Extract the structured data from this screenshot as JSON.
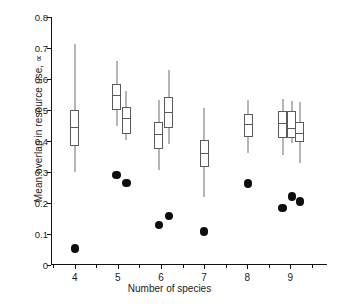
{
  "chart_data": {
    "type": "box",
    "title": "",
    "xlabel": "Number of species",
    "ylabel": "Mean overlap in resource use, ∝",
    "xlim": [
      3.45,
      9.85
    ],
    "ylim": [
      0,
      0.8
    ],
    "yticks": [
      "0",
      "0.1",
      "0.2",
      "0.3",
      "0.4",
      "0.5",
      "0.6",
      "0.7",
      "0.8"
    ],
    "ytick_values": [
      0,
      0.1,
      0.2,
      0.3,
      0.4,
      0.5,
      0.6,
      0.7,
      0.8
    ],
    "xticks": [
      "4",
      "5",
      "6",
      "7",
      "8",
      "9"
    ],
    "xtick_values": [
      4,
      5,
      6,
      7,
      8,
      9
    ],
    "grid": false,
    "legend": "none",
    "boxes": [
      {
        "name": "box-4-a",
        "x": 4.0,
        "whisker_low": 0.3,
        "q1": 0.385,
        "median": 0.446,
        "q3": 0.5,
        "whisker_high": 0.714
      },
      {
        "name": "box-5-a",
        "x": 4.97,
        "whisker_low": 0.447,
        "q1": 0.5,
        "median": 0.549,
        "q3": 0.585,
        "whisker_high": 0.658
      },
      {
        "name": "box-5-b",
        "x": 5.2,
        "whisker_low": 0.403,
        "q1": 0.424,
        "median": 0.474,
        "q3": 0.51,
        "whisker_high": 0.562
      },
      {
        "name": "box-6-a",
        "x": 5.95,
        "whisker_low": 0.308,
        "q1": 0.374,
        "median": 0.424,
        "q3": 0.462,
        "whisker_high": 0.532
      },
      {
        "name": "box-6-b",
        "x": 6.18,
        "whisker_low": 0.39,
        "q1": 0.441,
        "median": 0.494,
        "q3": 0.543,
        "whisker_high": 0.628
      },
      {
        "name": "box-7-a",
        "x": 7.0,
        "whisker_low": 0.22,
        "q1": 0.317,
        "median": 0.362,
        "q3": 0.404,
        "whisker_high": 0.505
      },
      {
        "name": "box-8-a",
        "x": 8.02,
        "whisker_low": 0.36,
        "q1": 0.412,
        "median": 0.455,
        "q3": 0.487,
        "whisker_high": 0.533
      },
      {
        "name": "box-9-a",
        "x": 8.82,
        "whisker_low": 0.355,
        "q1": 0.41,
        "median": 0.459,
        "q3": 0.496,
        "whisker_high": 0.535
      },
      {
        "name": "box-9-b",
        "x": 9.03,
        "whisker_low": 0.394,
        "q1": 0.411,
        "median": 0.443,
        "q3": 0.496,
        "whisker_high": 0.53
      },
      {
        "name": "box-9-c",
        "x": 9.22,
        "whisker_low": 0.33,
        "q1": 0.396,
        "median": 0.427,
        "q3": 0.46,
        "whisker_high": 0.525
      }
    ],
    "points": [
      {
        "name": "point-4-a",
        "x": 4.0,
        "y": 0.053
      },
      {
        "name": "point-5-a",
        "x": 4.97,
        "y": 0.291
      },
      {
        "name": "point-5-b",
        "x": 5.2,
        "y": 0.264
      },
      {
        "name": "point-6-a",
        "x": 5.95,
        "y": 0.128
      },
      {
        "name": "point-6-b",
        "x": 6.18,
        "y": 0.158
      },
      {
        "name": "point-7-a",
        "x": 7.0,
        "y": 0.108
      },
      {
        "name": "point-8-a",
        "x": 8.02,
        "y": 0.263
      },
      {
        "name": "point-9-a",
        "x": 8.82,
        "y": 0.183
      },
      {
        "name": "point-9-b",
        "x": 9.03,
        "y": 0.221
      },
      {
        "name": "point-9-c",
        "x": 9.22,
        "y": 0.205
      }
    ],
    "colors": {
      "axis": "#111111",
      "box_stroke": "#5a5a5a",
      "box_fill": "#ffffff",
      "whisker": "#6e6e6e",
      "point_fill": "#0d0d0d",
      "background": "#ffffff"
    }
  }
}
